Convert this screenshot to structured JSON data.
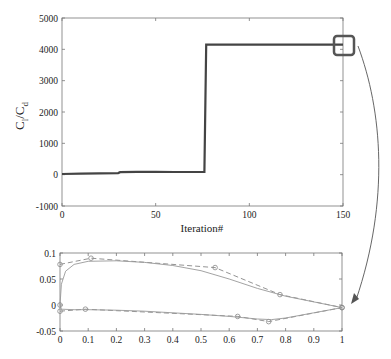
{
  "chart_data": [
    {
      "type": "line",
      "title": "",
      "xlabel": "Iteration#",
      "ylabel": "C_l / C_d",
      "ylabel_main": "C",
      "ylabel_sub1": "l",
      "ylabel_slash": "/C",
      "ylabel_sub2": "d",
      "xlim": [
        0,
        150
      ],
      "ylim": [
        -1000,
        5000
      ],
      "xticks": [
        0,
        50,
        100,
        150
      ],
      "yticks": [
        -1000,
        0,
        1000,
        2000,
        3000,
        4000,
        5000
      ],
      "xtick_labels": [
        "0",
        "50",
        "100",
        "150"
      ],
      "ytick_labels": [
        "-1000",
        "0",
        "1000",
        "2000",
        "3000",
        "4000",
        "5000"
      ],
      "grid": false,
      "series": [
        {
          "name": "Cl/Cd history",
          "color": "#444444",
          "x": [
            0,
            10,
            20,
            30,
            31,
            40,
            50,
            60,
            70,
            76,
            77,
            100,
            150
          ],
          "y": [
            20,
            30,
            40,
            50,
            80,
            90,
            90,
            85,
            85,
            85,
            4150,
            4150,
            4150
          ]
        }
      ],
      "annotations": [
        {
          "type": "highlight-box",
          "x": 150,
          "y": 4150,
          "note": "zoom box linking to airfoil plot below"
        }
      ]
    },
    {
      "type": "line",
      "title": "",
      "xlabel": "",
      "ylabel": "",
      "xlim": [
        0,
        1
      ],
      "ylim": [
        -0.05,
        0.1
      ],
      "xticks": [
        0,
        0.1,
        0.2,
        0.3,
        0.4,
        0.5,
        0.6,
        0.7,
        0.8,
        0.9,
        1
      ],
      "yticks": [
        -0.05,
        0,
        0.05,
        0.1
      ],
      "xtick_labels": [
        "0",
        "0.1",
        "0.2",
        "0.3",
        "0.4",
        "0.5",
        "0.6",
        "0.7",
        "0.8",
        "0.9",
        "1"
      ],
      "ytick_labels": [
        "-0.05",
        "0",
        "0.05",
        "0.1"
      ],
      "grid": false,
      "series": [
        {
          "name": "Control polygon (upper)",
          "style": "dashed",
          "marker": "circle",
          "color": "#888888",
          "x": [
            0,
            0.11,
            0.55,
            0.78,
            1
          ],
          "y": [
            0.078,
            0.09,
            0.072,
            0.02,
            -0.005
          ]
        },
        {
          "name": "Control polygon (lower)",
          "style": "dashed",
          "marker": "circle",
          "color": "#888888",
          "x": [
            0,
            0.09,
            0.63,
            0.74,
            1
          ],
          "y": [
            -0.012,
            -0.008,
            -0.022,
            -0.032,
            -0.005
          ]
        },
        {
          "name": "Airfoil upper surface",
          "style": "solid",
          "color": "#999999",
          "x": [
            0,
            0.005,
            0.02,
            0.05,
            0.1,
            0.2,
            0.3,
            0.4,
            0.5,
            0.6,
            0.7,
            0.8,
            0.9,
            1
          ],
          "y": [
            0,
            0.04,
            0.065,
            0.078,
            0.084,
            0.085,
            0.082,
            0.076,
            0.066,
            0.05,
            0.032,
            0.017,
            0.006,
            -0.005
          ]
        },
        {
          "name": "Airfoil lower surface",
          "style": "solid",
          "color": "#999999",
          "x": [
            0,
            0.005,
            0.05,
            0.1,
            0.2,
            0.3,
            0.4,
            0.5,
            0.6,
            0.7,
            0.75,
            0.8,
            0.9,
            1
          ],
          "y": [
            0,
            -0.008,
            -0.009,
            -0.009,
            -0.01,
            -0.012,
            -0.015,
            -0.018,
            -0.022,
            -0.027,
            -0.028,
            -0.025,
            -0.015,
            -0.005
          ]
        },
        {
          "name": "Leading edge point",
          "marker": "circle",
          "color": "#888888",
          "x": [
            0
          ],
          "y": [
            0
          ]
        }
      ]
    }
  ],
  "colors": {
    "main_line": "#444444",
    "axes": "#666666",
    "airfoil": "#999999",
    "highlight_box": "#555555",
    "arrow": "#555555"
  }
}
